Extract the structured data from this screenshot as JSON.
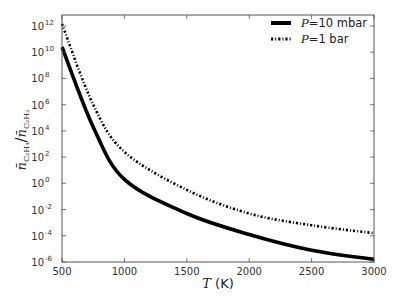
{
  "chart_data": {
    "type": "line",
    "title": "",
    "xlabel": "T (K)",
    "xlabel_var": "T",
    "xlabel_unit": "(K)",
    "ylabel": "n̄_{C2H4} / n̄_{C2H2}",
    "xlim": [
      500,
      3000
    ],
    "ylim": [
      1e-06,
      10000000000000.0
    ],
    "yscale": "log",
    "grid": false,
    "legend_position": "upper right",
    "x_ticks": [
      500,
      1000,
      1500,
      2000,
      2500,
      3000
    ],
    "y_ticks": [
      {
        "base": "10",
        "exp": "12"
      },
      {
        "base": "10",
        "exp": "10"
      },
      {
        "base": "10",
        "exp": "8"
      },
      {
        "base": "10",
        "exp": "6"
      },
      {
        "base": "10",
        "exp": "4"
      },
      {
        "base": "10",
        "exp": "2"
      },
      {
        "base": "10",
        "exp": "0"
      },
      {
        "base": "10",
        "exp": "-2"
      },
      {
        "base": "10",
        "exp": "-4"
      },
      {
        "base": "10",
        "exp": "-6"
      }
    ],
    "x": [
      500,
      750,
      1000,
      1500,
      2000,
      2500,
      3000
    ],
    "series": [
      {
        "name": "P=10 mbar",
        "legend_var": "P",
        "legend_value": "=10 mbar",
        "style": "solid",
        "color": "#000000",
        "log10_values": [
          10.4,
          4.3,
          0.3,
          -2.3,
          -3.9,
          -5.1,
          -5.8
        ]
      },
      {
        "name": "P=1 bar",
        "legend_var": "P",
        "legend_value": "=1 bar",
        "style": "dashdot",
        "color": "#000000",
        "log10_values": [
          12.15,
          6.0,
          2.4,
          -0.5,
          -2.3,
          -3.2,
          -3.8
        ]
      }
    ]
  },
  "ylabel_parts": {
    "num": "n̄",
    "num_sub": "C₂H₄",
    "den": "n̄",
    "den_sub": "C₂H₂"
  }
}
